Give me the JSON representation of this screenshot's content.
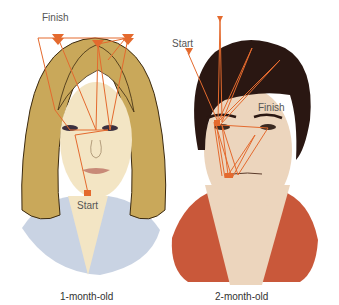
{
  "figures": [
    {
      "caption": "1-month-old",
      "start_label": "Start",
      "finish_label": "Finish",
      "colors": {
        "hair": "#c9a85a",
        "skin": "#f3e5c4",
        "shirt": "#c9d3e3",
        "scanpath": "#e46a2e"
      }
    },
    {
      "caption": "2-month-old",
      "start_label": "Start",
      "finish_label": "Finish",
      "colors": {
        "hair": "#2a1712",
        "skin": "#ecd5bd",
        "shirt": "#c9583a",
        "scanpath": "#e46a2e"
      }
    }
  ]
}
